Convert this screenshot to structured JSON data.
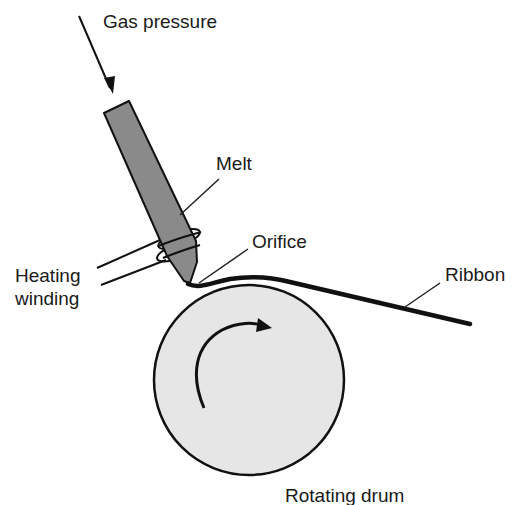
{
  "diagram": {
    "labels": {
      "gas_pressure": "Gas pressure",
      "melt": "Melt",
      "orifice": "Orifice",
      "heating_line1": "Heating",
      "heating_line2": "winding",
      "ribbon": "Ribbon",
      "drum": "Rotating drum"
    },
    "components": [
      {
        "id": "nozzle",
        "description": "Crucible/nozzle containing melt, tilted"
      },
      {
        "id": "heating-winding",
        "description": "Induction coil around nozzle tip"
      },
      {
        "id": "orifice",
        "description": "Nozzle exit above drum"
      },
      {
        "id": "ribbon",
        "description": "Solidified ribbon leaving drum surface"
      },
      {
        "id": "drum",
        "description": "Rotating quench wheel with clockwise rotation arrow"
      }
    ],
    "colors": {
      "nozzle_fill": "#8a8a8a",
      "drum_fill": "#e6e6e6",
      "stroke": "#111111"
    }
  }
}
